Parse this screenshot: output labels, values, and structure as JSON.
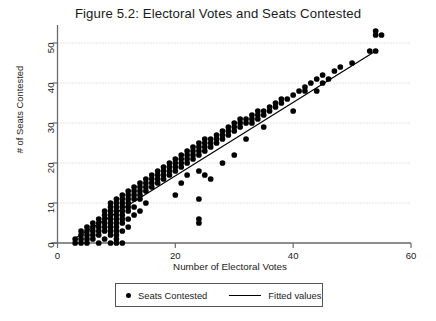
{
  "chart_data": {
    "type": "scatter",
    "title": "Figure 5.2: Electoral Votes and Seats Contested",
    "xlabel": "Number of Electoral Votes",
    "ylabel": "# of Seats Contested",
    "xlim": [
      0,
      60
    ],
    "ylim": [
      0,
      55
    ],
    "xticks": [
      0,
      20,
      40,
      60
    ],
    "yticks": [
      0,
      10,
      20,
      30,
      40,
      50
    ],
    "grid": "horizontal-dotted",
    "legend_position": "below-axis",
    "legend": [
      {
        "label": "Seats Contested",
        "marker": "filled-circle",
        "color": "#000000"
      },
      {
        "label": "Fitted values",
        "marker": "line",
        "color": "#000000"
      }
    ],
    "series": [
      {
        "name": "Seats Contested",
        "type": "scatter",
        "marker_color": "#000000",
        "points": [
          [
            3,
            0
          ],
          [
            3,
            1
          ],
          [
            4,
            0
          ],
          [
            4,
            1
          ],
          [
            4,
            2
          ],
          [
            4,
            3
          ],
          [
            5,
            0
          ],
          [
            5,
            1
          ],
          [
            5,
            2
          ],
          [
            5,
            3
          ],
          [
            5,
            4
          ],
          [
            6,
            1
          ],
          [
            6,
            2
          ],
          [
            6,
            3
          ],
          [
            6,
            4
          ],
          [
            6,
            5
          ],
          [
            7,
            0
          ],
          [
            7,
            2
          ],
          [
            7,
            3
          ],
          [
            7,
            4
          ],
          [
            7,
            5
          ],
          [
            7,
            6
          ],
          [
            8,
            1
          ],
          [
            8,
            3
          ],
          [
            8,
            4
          ],
          [
            8,
            5
          ],
          [
            8,
            6
          ],
          [
            8,
            7
          ],
          [
            8,
            8
          ],
          [
            9,
            0
          ],
          [
            9,
            2
          ],
          [
            9,
            3
          ],
          [
            9,
            4
          ],
          [
            9,
            5
          ],
          [
            9,
            6
          ],
          [
            9,
            7
          ],
          [
            9,
            8
          ],
          [
            9,
            9
          ],
          [
            9,
            10
          ],
          [
            10,
            0
          ],
          [
            10,
            1
          ],
          [
            10,
            2
          ],
          [
            10,
            3
          ],
          [
            10,
            4
          ],
          [
            10,
            5
          ],
          [
            10,
            6
          ],
          [
            10,
            7
          ],
          [
            10,
            8
          ],
          [
            10,
            9
          ],
          [
            10,
            10
          ],
          [
            10,
            11
          ],
          [
            11,
            0
          ],
          [
            11,
            3
          ],
          [
            11,
            5
          ],
          [
            11,
            6
          ],
          [
            11,
            7
          ],
          [
            11,
            8
          ],
          [
            11,
            9
          ],
          [
            11,
            10
          ],
          [
            11,
            11
          ],
          [
            11,
            12
          ],
          [
            12,
            4
          ],
          [
            12,
            6
          ],
          [
            12,
            8
          ],
          [
            12,
            9
          ],
          [
            12,
            10
          ],
          [
            12,
            11
          ],
          [
            12,
            12
          ],
          [
            12,
            13
          ],
          [
            13,
            7
          ],
          [
            13,
            9
          ],
          [
            13,
            11
          ],
          [
            13,
            12
          ],
          [
            13,
            13
          ],
          [
            13,
            14
          ],
          [
            14,
            8
          ],
          [
            14,
            11
          ],
          [
            14,
            12
          ],
          [
            14,
            13
          ],
          [
            14,
            14
          ],
          [
            14,
            15
          ],
          [
            15,
            10
          ],
          [
            15,
            13
          ],
          [
            15,
            14
          ],
          [
            15,
            15
          ],
          [
            15,
            16
          ],
          [
            16,
            14
          ],
          [
            16,
            15
          ],
          [
            16,
            16
          ],
          [
            16,
            17
          ],
          [
            17,
            15
          ],
          [
            17,
            16
          ],
          [
            17,
            17
          ],
          [
            17,
            18
          ],
          [
            18,
            16
          ],
          [
            18,
            17
          ],
          [
            18,
            18
          ],
          [
            18,
            19
          ],
          [
            19,
            17
          ],
          [
            19,
            18
          ],
          [
            19,
            19
          ],
          [
            19,
            20
          ],
          [
            20,
            12
          ],
          [
            20,
            18
          ],
          [
            20,
            19
          ],
          [
            20,
            20
          ],
          [
            20,
            21
          ],
          [
            21,
            15
          ],
          [
            21,
            19
          ],
          [
            21,
            20
          ],
          [
            21,
            21
          ],
          [
            21,
            22
          ],
          [
            22,
            17
          ],
          [
            22,
            20
          ],
          [
            22,
            21
          ],
          [
            22,
            22
          ],
          [
            22,
            23
          ],
          [
            23,
            21
          ],
          [
            23,
            22
          ],
          [
            23,
            23
          ],
          [
            23,
            24
          ],
          [
            24,
            5
          ],
          [
            24,
            6
          ],
          [
            24,
            11
          ],
          [
            24,
            18
          ],
          [
            24,
            22
          ],
          [
            24,
            23
          ],
          [
            24,
            24
          ],
          [
            24,
            25
          ],
          [
            25,
            17
          ],
          [
            25,
            23
          ],
          [
            25,
            24
          ],
          [
            25,
            25
          ],
          [
            25,
            26
          ],
          [
            26,
            16
          ],
          [
            26,
            24
          ],
          [
            26,
            25
          ],
          [
            26,
            26
          ],
          [
            27,
            25
          ],
          [
            27,
            26
          ],
          [
            27,
            27
          ],
          [
            28,
            20
          ],
          [
            28,
            26
          ],
          [
            28,
            27
          ],
          [
            28,
            28
          ],
          [
            29,
            27
          ],
          [
            29,
            28
          ],
          [
            29,
            29
          ],
          [
            30,
            22
          ],
          [
            30,
            28
          ],
          [
            30,
            29
          ],
          [
            30,
            30
          ],
          [
            31,
            29
          ],
          [
            31,
            30
          ],
          [
            31,
            31
          ],
          [
            32,
            26
          ],
          [
            32,
            30
          ],
          [
            32,
            31
          ],
          [
            33,
            30
          ],
          [
            33,
            31
          ],
          [
            33,
            32
          ],
          [
            34,
            31
          ],
          [
            34,
            32
          ],
          [
            34,
            33
          ],
          [
            35,
            29
          ],
          [
            35,
            32
          ],
          [
            35,
            33
          ],
          [
            36,
            33
          ],
          [
            36,
            34
          ],
          [
            37,
            34
          ],
          [
            37,
            35
          ],
          [
            38,
            35
          ],
          [
            38,
            36
          ],
          [
            39,
            36
          ],
          [
            40,
            33
          ],
          [
            40,
            37
          ],
          [
            41,
            38
          ],
          [
            42,
            38
          ],
          [
            42,
            39
          ],
          [
            43,
            40
          ],
          [
            44,
            38
          ],
          [
            44,
            41
          ],
          [
            45,
            40
          ],
          [
            45,
            42
          ],
          [
            46,
            41
          ],
          [
            47,
            43
          ],
          [
            48,
            44
          ],
          [
            50,
            45
          ],
          [
            53,
            48
          ],
          [
            54,
            48
          ],
          [
            54,
            52
          ],
          [
            54,
            53
          ],
          [
            55,
            52
          ]
        ]
      },
      {
        "name": "Fitted values",
        "type": "line",
        "color": "#000000",
        "x_range": [
          3,
          54
        ],
        "y_range": [
          1.2,
          48.0
        ]
      }
    ]
  }
}
